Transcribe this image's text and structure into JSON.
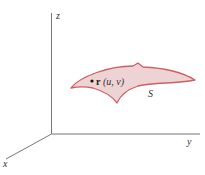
{
  "diagram": {
    "axes": {
      "x_label": "x",
      "y_label": "y",
      "z_label": "z",
      "color": "#777777"
    },
    "surface": {
      "label": "S",
      "fill": "#edd3d3",
      "stroke": "#cf5f62"
    },
    "point": {
      "vector": "r",
      "args": "(u, v)"
    }
  }
}
